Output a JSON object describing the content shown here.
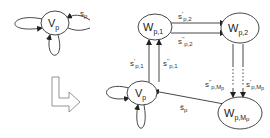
{
  "diagram": {
    "type": "state-transition-transformation",
    "left_graph": {
      "nodes": [
        {
          "id": "vp_left",
          "label_main": "V",
          "label_sub": "p"
        }
      ],
      "edges": [
        {
          "from": "vp_left",
          "to": "vp_left",
          "kind": "self-loop-left"
        },
        {
          "from": "vp_left",
          "to": "vp_left",
          "kind": "self-loop-bottom"
        },
        {
          "from": "vp_left",
          "to": "external",
          "label_main": "s",
          "label_sub": "p"
        }
      ]
    },
    "transform_arrow": {
      "icon": "bent-arrow-right-icon"
    },
    "right_graph": {
      "nodes": [
        {
          "id": "wp1",
          "label_main": "W",
          "label_sub": "p,1"
        },
        {
          "id": "wp2",
          "label_main": "W",
          "label_sub": "p,2"
        },
        {
          "id": "vp",
          "label_main": "V",
          "label_sub": "p"
        },
        {
          "id": "wpmp",
          "label_main": "W",
          "label_sub": "p,M",
          "label_subsub": "p"
        }
      ],
      "edges": [
        {
          "from": "wp1",
          "to": "wp2",
          "label_main": "s",
          "label_prime": "'",
          "label_sub": "p,2"
        },
        {
          "from": "wp1",
          "to": "wp2",
          "label_main": "s",
          "label_prime": "''",
          "label_sub": "p,2"
        },
        {
          "from": "vp",
          "to": "wp1",
          "label_main": "s",
          "label_prime": "'",
          "label_sub": "p,1"
        },
        {
          "from": "vp",
          "to": "wp1",
          "label_main": "s",
          "label_prime": "''",
          "label_sub": "p,1"
        },
        {
          "from": "wp2",
          "to": "wpmp",
          "label_main": "s",
          "label_prime": "''",
          "label_sub": "p,M",
          "label_subsub": "p",
          "style": "dotted-middle"
        },
        {
          "from": "wp2",
          "to": "wpmp",
          "label_main": "s",
          "label_prime": "'",
          "label_sub": "p,M",
          "label_subsub": "p",
          "style": "dotted-middle"
        },
        {
          "from": "wpmp",
          "to": "vp",
          "label_main": "ŝ",
          "label_sub": "p"
        },
        {
          "from": "vp",
          "to": "vp",
          "kind": "self-loop-left"
        },
        {
          "from": "vp",
          "to": "vp",
          "kind": "self-loop-bottom"
        }
      ]
    },
    "colors": {
      "stroke": "#333333",
      "arrow_outline": "#888888",
      "background": "#ffffff"
    }
  }
}
